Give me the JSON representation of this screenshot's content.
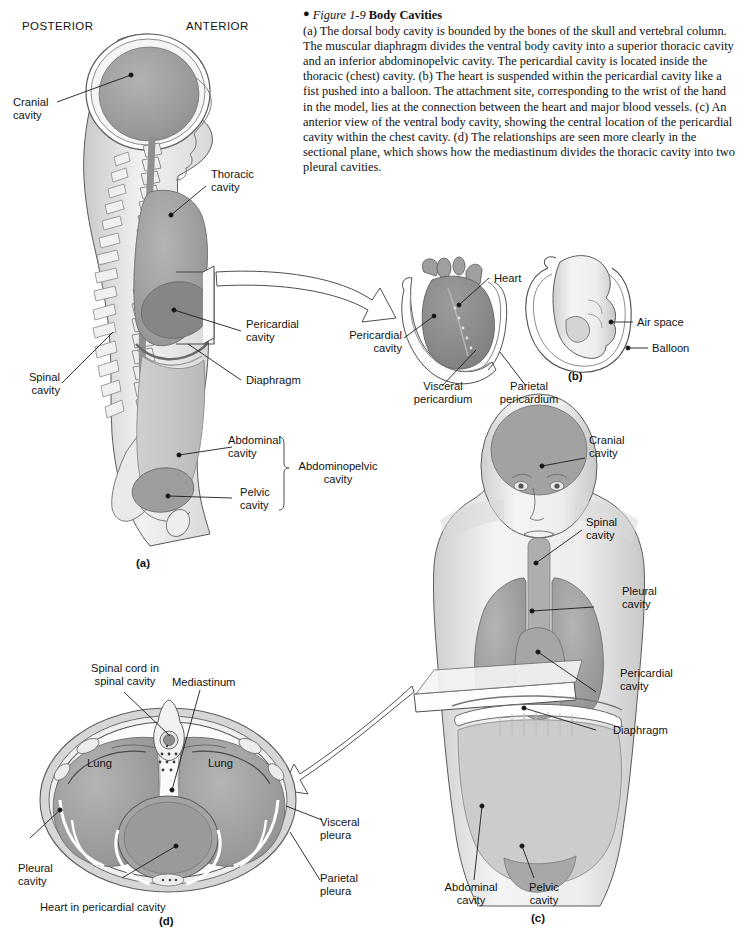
{
  "figure": {
    "bullet": "●",
    "number": "Figure 1-9",
    "title": "Body Cavities",
    "caption": "(a) The dorsal body cavity is bounded by the bones of the skull and vertebral column. The muscular diaphragm divides the ventral body cavity into a superior thoracic cavity and an inferior abdominopelvic cavity. The pericardial cavity is located inside the thoracic (chest) cavity. (b) The heart is suspended within the pericardial cavity like a fist pushed into a balloon. The attachment site, corresponding to the wrist of the hand in the model, lies at the connection between the heart and major blood vessels. (c) An anterior view of the ventral body cavity, showing the central location of the pericardial cavity within the chest cavity. (d) The relationships are seen more clearly in the sectional plane, which shows how the mediastinum divides the thoracic cavity into two pleural cavities."
  },
  "panel_a": {
    "letter": "(a)",
    "orientation": {
      "posterior": "POSTERIOR",
      "anterior": "ANTERIOR"
    },
    "labels": {
      "cranial": "Cranial\ncavity",
      "thoracic": "Thoracic\ncavity",
      "pericardial": "Pericardial\ncavity",
      "diaphragm": "Diaphragm",
      "spinal": "Spinal\ncavity",
      "abdominal": "Abdominal\ncavity",
      "pelvic": "Pelvic\ncavity",
      "abdominopelvic": "Abdominopelvic\ncavity"
    }
  },
  "panel_b": {
    "letter": "(b)",
    "labels": {
      "heart": "Heart",
      "pericardial": "Pericardial\ncavity",
      "visceral": "Visceral\npericardium",
      "parietal": "Parietal\npericardium",
      "air_space": "Air space",
      "balloon": "Balloon"
    }
  },
  "panel_c": {
    "letter": "(c)",
    "labels": {
      "cranial": "Cranial\ncavity",
      "spinal": "Spinal\ncavity",
      "pleural": "Pleural\ncavity",
      "pericardial": "Pericardial\ncavity",
      "diaphragm": "Diaphragm",
      "abdominal": "Abdominal\ncavity",
      "pelvic": "Pelvic\ncavity"
    }
  },
  "panel_d": {
    "letter": "(d)",
    "labels": {
      "spinal_cord": "Spinal cord in\nspinal cavity",
      "mediastinum": "Mediastinum",
      "lung_left": "Lung",
      "lung_right": "Lung",
      "pleural": "Pleural\ncavity",
      "visceral": "Visceral\npleura",
      "parietal": "Parietal\npleura",
      "heart": "Heart in pericardial cavity"
    }
  },
  "colors": {
    "cavity_dark": "#8c8c8c",
    "cavity_mid": "#9e9e9e",
    "cavity_light": "#c6c6c6",
    "body_tint": "#e8e8e8",
    "outline": "#5c5c5c",
    "text": "#131313"
  }
}
